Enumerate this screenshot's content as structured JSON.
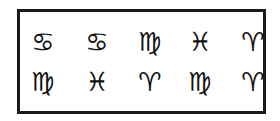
{
  "colors": {
    "border": "#1a1a1a",
    "symbol": "#111111",
    "background": "#ffffff"
  },
  "grid": {
    "rows": [
      [
        {
          "name": "cancer",
          "glyph": "♋"
        },
        {
          "name": "cancer",
          "glyph": "♋"
        },
        {
          "name": "virgo",
          "glyph": "♍"
        },
        {
          "name": "pisces",
          "glyph": "♓"
        },
        {
          "name": "aries",
          "glyph": "♈"
        }
      ],
      [
        {
          "name": "virgo",
          "glyph": "♍"
        },
        {
          "name": "pisces",
          "glyph": "♓"
        },
        {
          "name": "aries",
          "glyph": "♈"
        },
        {
          "name": "virgo",
          "glyph": "♍"
        },
        {
          "name": "aries",
          "glyph": "♈"
        }
      ]
    ]
  }
}
